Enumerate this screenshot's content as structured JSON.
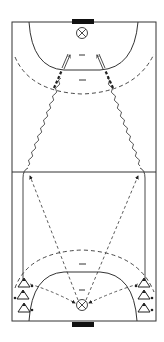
{
  "diagram": {
    "type": "handball-drill",
    "court": {
      "x": 12,
      "y": 22,
      "width": 144,
      "height": 299,
      "midline_y": 172,
      "line_color": "#333333"
    },
    "colors": {
      "line": "#333333",
      "goal": "#111111",
      "background": "#ffffff"
    },
    "goals": [
      {
        "id": "top",
        "x": 72,
        "y": 19,
        "width": 22,
        "height": 6
      },
      {
        "id": "bottom",
        "x": 72,
        "y": 322,
        "width": 22,
        "height": 6
      }
    ],
    "targets": [
      {
        "id": "top-target",
        "cx": 82,
        "cy": 33,
        "r": 6,
        "icon": "cross-circle-icon"
      },
      {
        "id": "bottom-target",
        "cx": 82,
        "cy": 305,
        "r": 6,
        "icon": "cross-circle-icon"
      }
    ],
    "players": [
      {
        "id": "left-1",
        "cx": 24,
        "cy": 283,
        "icon": "cone-triangle-icon"
      },
      {
        "id": "left-2",
        "cx": 22,
        "cy": 295,
        "icon": "cone-triangle-icon"
      },
      {
        "id": "left-3",
        "cx": 24,
        "cy": 308,
        "icon": "cone-triangle-icon"
      },
      {
        "id": "right-1",
        "cx": 144,
        "cy": 283,
        "icon": "cone-triangle-icon"
      },
      {
        "id": "right-2",
        "cx": 144,
        "cy": 295,
        "icon": "cone-triangle-icon"
      },
      {
        "id": "right-3",
        "cx": 144,
        "cy": 308,
        "icon": "cone-triangle-icon"
      }
    ]
  }
}
